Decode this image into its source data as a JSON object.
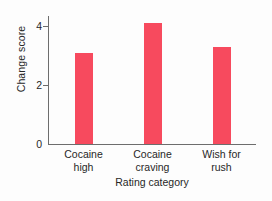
{
  "chart_data": {
    "type": "bar",
    "title": "",
    "xlabel": "Rating category",
    "ylabel": "Change score",
    "categories": [
      "Cocaine high",
      "Cocaine craving",
      "Wish for rush"
    ],
    "category_lines": [
      {
        "line1": "Cocaine",
        "line2": "high"
      },
      {
        "line1": "Cocaine",
        "line2": "craving"
      },
      {
        "line1": "Wish for",
        "line2": "rush"
      }
    ],
    "values": [
      3.1,
      4.1,
      3.3
    ],
    "ylim": [
      0,
      4.35
    ],
    "yticks": [
      0,
      2,
      4
    ],
    "ytick_labels": [
      "0",
      "2",
      "4"
    ],
    "grid": false,
    "legend": null,
    "bar_color": "#f74a5e",
    "axis_color": "#6d6d6d",
    "background": "#fdfdfd"
  }
}
